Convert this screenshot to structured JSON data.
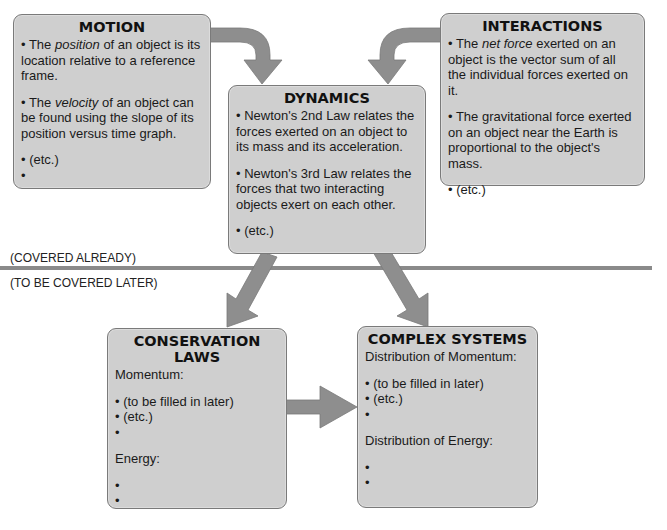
{
  "boxes": {
    "motion": {
      "title": "MOTION",
      "items": [
        {
          "pre": "• The ",
          "em": "position",
          "post": " of an object is its location relative to a reference frame."
        },
        {
          "pre": "• The ",
          "em": "velocity",
          "post": " of an object can be found using the slope of its position versus time graph."
        },
        {
          "text": "• (etc.)"
        },
        {
          "text": "•"
        }
      ]
    },
    "dynamics": {
      "title": "DYNAMICS",
      "items": [
        {
          "text": "• Newton's 2nd Law relates the forces exerted on an object to its mass and its acceleration."
        },
        {
          "text": "• Newton's 3rd Law relates the forces that two interacting objects exert on each other."
        },
        {
          "text": "• (etc.)"
        }
      ]
    },
    "interactions": {
      "title": "INTERACTIONS",
      "items": [
        {
          "pre": "• The ",
          "em": "net force",
          "post": " exerted on an object is the vector sum of all the individual forces exerted on it."
        },
        {
          "text": "• The gravitational force exerted on an object near the Earth is proportional to the object's mass."
        },
        {
          "text": "• (etc.)"
        }
      ]
    },
    "conservation": {
      "title": "CONSERVATION LAWS",
      "section1": "Momentum:",
      "section1_items": [
        "• (to be filled in later)",
        "• (etc.)",
        "•"
      ],
      "section2": "Energy:",
      "section2_items": [
        "•",
        "•"
      ]
    },
    "complex": {
      "title": "COMPLEX SYSTEMS",
      "section1": "Distribution of Momentum:",
      "section1_items": [
        "• (to be filled in later)",
        "• (etc.)",
        "•"
      ],
      "section2": "Distribution of Energy:",
      "section2_items": [
        "•",
        "•"
      ]
    }
  },
  "divider": {
    "above_label": "(COVERED ALREADY)",
    "below_label": "(TO BE COVERED LATER)"
  },
  "colors": {
    "box_fill": "#cfcfcf",
    "box_border": "#7a7a7a",
    "arrow_fill": "#8e8e8e",
    "divider": "#8a8a8a"
  },
  "arrows": [
    {
      "from": "MOTION",
      "to": "DYNAMICS"
    },
    {
      "from": "INTERACTIONS",
      "to": "DYNAMICS"
    },
    {
      "from": "DYNAMICS",
      "to": "CONSERVATION LAWS"
    },
    {
      "from": "DYNAMICS",
      "to": "COMPLEX SYSTEMS"
    },
    {
      "from": "CONSERVATION LAWS",
      "to": "COMPLEX SYSTEMS"
    }
  ]
}
